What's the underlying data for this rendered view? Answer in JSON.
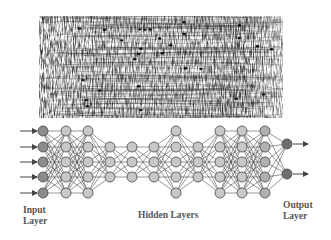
{
  "figure": {
    "top_panel": {
      "description": "neural tissue micrograph",
      "icon": "neuron-network-image-icon"
    },
    "labels": {
      "input": [
        "Input",
        "Layer"
      ],
      "hidden": "Hidden Layers",
      "output": [
        "Output",
        "Layer"
      ]
    },
    "network": {
      "layers": [
        {
          "name": "input",
          "x": 43,
          "nodes": 5,
          "color": "#8c8c8c"
        },
        {
          "name": "hidden1",
          "x": 66,
          "nodes": 5,
          "color": "#c8c8c8"
        },
        {
          "name": "hidden2",
          "x": 88,
          "nodes": 5,
          "color": "#c8c8c8"
        },
        {
          "name": "hidden3",
          "x": 110,
          "nodes": 3,
          "color": "#c8c8c8"
        },
        {
          "name": "hidden4",
          "x": 132,
          "nodes": 3,
          "color": "#c8c8c8"
        },
        {
          "name": "hidden5",
          "x": 154,
          "nodes": 3,
          "color": "#c8c8c8"
        },
        {
          "name": "hidden6",
          "x": 176,
          "nodes": 5,
          "color": "#c8c8c8"
        },
        {
          "name": "hidden7",
          "x": 198,
          "nodes": 3,
          "color": "#c8c8c8"
        },
        {
          "name": "hidden8",
          "x": 220,
          "nodes": 5,
          "color": "#c8c8c8"
        },
        {
          "name": "hidden9",
          "x": 242,
          "nodes": 5,
          "color": "#c8c8c8"
        },
        {
          "name": "hidden10",
          "x": 265,
          "nodes": 5,
          "color": "#b0b0b0"
        },
        {
          "name": "output",
          "x": 287,
          "nodes": 2,
          "color": "#6e6e6e"
        }
      ],
      "y5": [
        131,
        147,
        162,
        177,
        193
      ],
      "y3": [
        147,
        162,
        177
      ],
      "y2": [
        144,
        174
      ],
      "node_radius": 5,
      "edge_color": "#333333",
      "input_arrows": 5,
      "output_arrows": 2
    }
  }
}
